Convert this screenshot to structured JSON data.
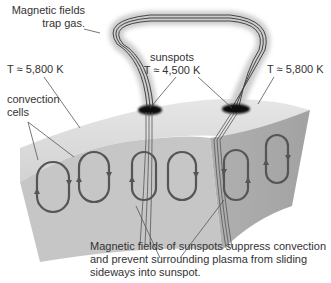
{
  "diagram": {
    "labels": {
      "magnetic_fields_trap": [
        "Magnetic fields",
        "trap gas."
      ],
      "temp_left": "T ≈ 5,800 K",
      "temp_right": "T ≈ 5,800 K",
      "sunspots": [
        "sunspots",
        "T ≈ 4,500 K"
      ],
      "convection_cells": [
        "convection",
        "cells"
      ],
      "caption": [
        "Magnetic fields of sunspots suppress convection",
        "and prevent surrounding plasma from sliding",
        "sideways into sunspot."
      ]
    },
    "colors": {
      "top_surface": "#d9d9d9",
      "front_face": "#c4c4c4",
      "side_face": "#a9a9a9",
      "loops": "#555555",
      "field_lines": "#444444",
      "sunspot": "#111111",
      "text": "#333333"
    }
  }
}
